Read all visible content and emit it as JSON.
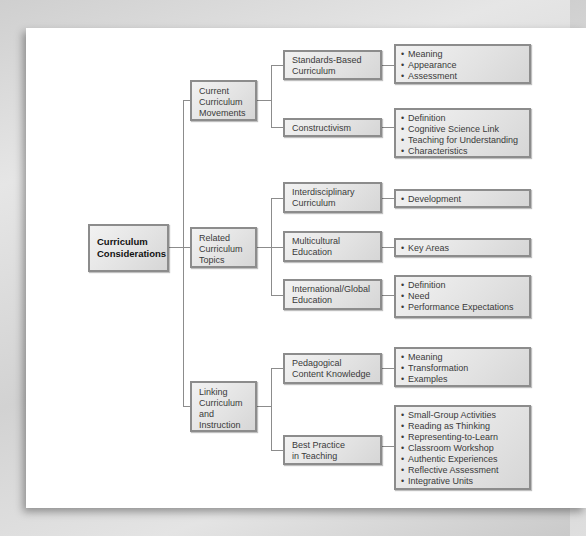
{
  "diagram": {
    "root": {
      "label_line1": "Curriculum",
      "label_line2": "Considerations"
    },
    "branches": [
      {
        "label_lines": [
          "Current",
          "Curriculum",
          "Movements"
        ],
        "children": [
          {
            "label_lines": [
              "Standards-Based",
              "Curriculum"
            ],
            "items": [
              "Meaning",
              "Appearance",
              "Assessment"
            ]
          },
          {
            "label_lines": [
              "Constructivism"
            ],
            "items": [
              "Definition",
              "Cognitive Science Link",
              "Teaching for Understanding",
              "Characteristics"
            ]
          }
        ]
      },
      {
        "label_lines": [
          "Related",
          "Curriculum",
          "Topics"
        ],
        "children": [
          {
            "label_lines": [
              "Interdisciplinary",
              "Curriculum"
            ],
            "items": [
              "Development"
            ]
          },
          {
            "label_lines": [
              "Multicultural",
              "Education"
            ],
            "items": [
              "Key Areas"
            ]
          },
          {
            "label_lines": [
              "International/Global",
              "Education"
            ],
            "items": [
              "Definition",
              "Need",
              "Performance Expectations"
            ]
          }
        ]
      },
      {
        "label_lines": [
          "Linking",
          "Curriculum",
          "and",
          "Instruction"
        ],
        "children": [
          {
            "label_lines": [
              "Pedagogical",
              "Content Knowledge"
            ],
            "items": [
              "Meaning",
              "Transformation",
              "Examples"
            ]
          },
          {
            "label_lines": [
              "Best Practice",
              "in Teaching"
            ],
            "items": [
              "Small-Group Activities",
              "Reading as Thinking",
              "Representing-to-Learn",
              "Classroom Workshop",
              "Authentic Experiences",
              "Reflective Assessment",
              "Integrative Units"
            ]
          }
        ]
      }
    ],
    "bullet_glyph": "•"
  }
}
